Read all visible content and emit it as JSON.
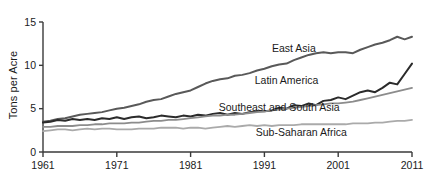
{
  "chart_data": {
    "type": "line",
    "title": "",
    "xlabel": "",
    "ylabel": "Tons per Acre",
    "xlim": [
      1961,
      2011
    ],
    "ylim": [
      0,
      15
    ],
    "yticks": [
      0,
      5,
      10,
      15
    ],
    "ytick_labels": [
      "0",
      "5",
      "10",
      "15"
    ],
    "xticks": [
      1961,
      1971,
      1981,
      1991,
      2001,
      2011
    ],
    "xtick_labels": [
      "1961",
      "1971",
      "1981",
      "1991",
      "2001",
      "2011"
    ],
    "grid": false,
    "legend_position": "inline-right",
    "x": [
      1961,
      1962,
      1963,
      1964,
      1965,
      1966,
      1967,
      1968,
      1969,
      1970,
      1971,
      1972,
      1973,
      1974,
      1975,
      1976,
      1977,
      1978,
      1979,
      1980,
      1981,
      1982,
      1983,
      1984,
      1985,
      1986,
      1987,
      1988,
      1989,
      1990,
      1991,
      1992,
      1993,
      1994,
      1995,
      1996,
      1997,
      1998,
      1999,
      2000,
      2001,
      2002,
      2003,
      2004,
      2005,
      2006,
      2007,
      2008,
      2009,
      2010,
      2011
    ],
    "series": [
      {
        "name": "East Asia",
        "color": "#595959",
        "width": 2.0,
        "label_x": 1995,
        "label_y": 11.9,
        "values": [
          3.5,
          3.6,
          3.8,
          3.9,
          4.1,
          4.3,
          4.4,
          4.5,
          4.6,
          4.8,
          5.0,
          5.1,
          5.3,
          5.5,
          5.8,
          6.0,
          6.1,
          6.4,
          6.7,
          6.9,
          7.1,
          7.5,
          7.9,
          8.2,
          8.4,
          8.5,
          8.8,
          8.9,
          9.1,
          9.4,
          9.6,
          9.9,
          10.1,
          10.2,
          10.6,
          10.9,
          11.2,
          11.4,
          11.5,
          11.4,
          11.5,
          11.5,
          11.4,
          11.8,
          12.1,
          12.4,
          12.6,
          12.9,
          13.3,
          13.0,
          13.3
        ]
      },
      {
        "name": "Latin America",
        "color": "#2b2b2b",
        "width": 2.0,
        "label_x": 1994,
        "label_y": 8.3,
        "values": [
          3.4,
          3.5,
          3.7,
          3.6,
          3.8,
          3.7,
          3.8,
          3.7,
          3.9,
          3.8,
          4.0,
          3.8,
          4.0,
          4.1,
          3.9,
          4.0,
          4.2,
          4.1,
          4.0,
          4.2,
          4.1,
          4.3,
          4.2,
          4.4,
          4.5,
          4.3,
          4.5,
          4.4,
          4.6,
          4.7,
          4.7,
          4.8,
          5.1,
          5.0,
          5.4,
          5.3,
          5.6,
          5.4,
          5.9,
          6.0,
          6.3,
          6.1,
          6.5,
          6.9,
          7.1,
          6.9,
          7.4,
          8.0,
          7.8,
          9.0,
          10.2
        ]
      },
      {
        "name": "Southeast and South Asia",
        "color": "#8c8c8c",
        "width": 1.8,
        "label_x": 1993,
        "label_y": 5.2,
        "values": [
          2.9,
          2.9,
          3.0,
          3.0,
          3.0,
          3.1,
          3.1,
          3.2,
          3.2,
          3.3,
          3.3,
          3.3,
          3.4,
          3.4,
          3.5,
          3.6,
          3.6,
          3.7,
          3.7,
          3.8,
          3.9,
          4.0,
          4.1,
          4.2,
          4.2,
          4.3,
          4.3,
          4.4,
          4.5,
          4.6,
          4.7,
          4.8,
          4.9,
          5.0,
          5.1,
          5.2,
          5.3,
          5.4,
          5.5,
          5.6,
          5.6,
          5.7,
          5.8,
          6.0,
          6.2,
          6.4,
          6.6,
          6.8,
          7.0,
          7.2,
          7.4
        ]
      },
      {
        "name": "Sub-Saharan Africa",
        "color": "#aaaaaa",
        "width": 1.8,
        "label_x": 1996,
        "label_y": 2.3,
        "values": [
          2.4,
          2.5,
          2.6,
          2.6,
          2.5,
          2.6,
          2.7,
          2.6,
          2.7,
          2.7,
          2.6,
          2.6,
          2.6,
          2.7,
          2.7,
          2.7,
          2.8,
          2.8,
          2.8,
          2.7,
          2.8,
          2.8,
          2.7,
          2.8,
          2.9,
          3.0,
          2.9,
          3.0,
          3.1,
          3.0,
          3.1,
          3.0,
          3.1,
          3.1,
          3.1,
          3.2,
          3.2,
          3.2,
          3.2,
          3.2,
          3.2,
          3.2,
          3.3,
          3.3,
          3.3,
          3.4,
          3.4,
          3.5,
          3.6,
          3.6,
          3.7
        ]
      }
    ]
  }
}
